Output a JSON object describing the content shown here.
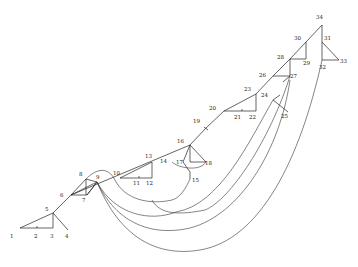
{
  "diagram": {
    "type": "tree-with-arcs",
    "background": "#ffffff",
    "stroke_color": "#222222",
    "nodes": [
      {
        "id": "1",
        "label": "1",
        "x": 20,
        "y": 228,
        "lx": 10,
        "ly": 238
      },
      {
        "id": "2",
        "label": "2",
        "x": 37,
        "y": 228,
        "lx": 34,
        "ly": 238
      },
      {
        "id": "3",
        "label": "3",
        "x": 53,
        "y": 228,
        "lx": 50,
        "ly": 238
      },
      {
        "id": "4",
        "label": "4",
        "x": 68,
        "y": 230,
        "lx": 65,
        "ly": 238
      },
      {
        "id": "5",
        "label": "5",
        "x": 53,
        "y": 213,
        "lx": 45,
        "ly": 211
      },
      {
        "id": "6",
        "label": "6",
        "x": 71,
        "y": 195,
        "lx": 60,
        "ly": 197
      },
      {
        "id": "7",
        "label": "7",
        "x": 87,
        "y": 195,
        "lx": 82,
        "ly": 202
      },
      {
        "id": "8",
        "label": "8",
        "x": 86,
        "y": 179,
        "lx": 79,
        "ly": 176
      },
      {
        "id": "9",
        "label": "9",
        "x": 97,
        "y": 182,
        "lx": 96,
        "ly": 179
      },
      {
        "id": "10",
        "label": "10",
        "x": 120,
        "y": 178,
        "lx": 113,
        "ly": 175
      },
      {
        "id": "11",
        "label": "11",
        "x": 139,
        "y": 178,
        "lx": 133,
        "ly": 185
      },
      {
        "id": "12",
        "label": "12",
        "x": 152,
        "y": 178,
        "lx": 146,
        "ly": 185
      },
      {
        "id": "13",
        "label": "13",
        "x": 152,
        "y": 162,
        "lx": 145,
        "ly": 158
      },
      {
        "id": "14",
        "label": "14",
        "x": 172,
        "y": 162,
        "lx": 160,
        "ly": 163
      },
      {
        "id": "15",
        "label": "15",
        "x": 190,
        "y": 179,
        "lx": 192,
        "ly": 182
      },
      {
        "id": "16",
        "label": "16",
        "x": 190,
        "y": 145,
        "lx": 177,
        "ly": 143
      },
      {
        "id": "17",
        "label": "17",
        "x": 183,
        "y": 162,
        "lx": 176,
        "ly": 164
      },
      {
        "id": "18",
        "label": "18",
        "x": 206,
        "y": 162,
        "lx": 205,
        "ly": 165
      },
      {
        "id": "19",
        "label": "19",
        "x": 206,
        "y": 128,
        "lx": 193,
        "ly": 123
      },
      {
        "id": "20",
        "label": "20",
        "x": 224,
        "y": 111,
        "lx": 209,
        "ly": 110
      },
      {
        "id": "21",
        "label": "21",
        "x": 242,
        "y": 111,
        "lx": 234,
        "ly": 119
      },
      {
        "id": "22",
        "label": "22",
        "x": 256,
        "y": 111,
        "lx": 249,
        "ly": 119
      },
      {
        "id": "23",
        "label": "23",
        "x": 256,
        "y": 94,
        "lx": 244,
        "ly": 91
      },
      {
        "id": "24",
        "label": "24",
        "x": 273,
        "y": 94,
        "lx": 261,
        "ly": 97
      },
      {
        "id": "25",
        "label": "25",
        "x": 288,
        "y": 112,
        "lx": 281,
        "ly": 118
      },
      {
        "id": "26",
        "label": "26",
        "x": 273,
        "y": 76,
        "lx": 259,
        "ly": 77
      },
      {
        "id": "27",
        "label": "27",
        "x": 290,
        "y": 76,
        "lx": 290,
        "ly": 78
      },
      {
        "id": "28",
        "label": "28",
        "x": 290,
        "y": 59,
        "lx": 277,
        "ly": 59
      },
      {
        "id": "29",
        "label": "29",
        "x": 306,
        "y": 59,
        "lx": 303,
        "ly": 65
      },
      {
        "id": "30",
        "label": "30",
        "x": 306,
        "y": 42,
        "lx": 294,
        "ly": 40
      },
      {
        "id": "31",
        "label": "31",
        "x": 322,
        "y": 42,
        "lx": 324,
        "ly": 40
      },
      {
        "id": "32",
        "label": "32",
        "x": 322,
        "y": 60,
        "lx": 319,
        "ly": 69
      },
      {
        "id": "33",
        "label": "33",
        "x": 339,
        "y": 60,
        "lx": 340,
        "ly": 63
      },
      {
        "id": "34",
        "label": "34",
        "x": 322,
        "y": 25,
        "lx": 316,
        "ly": 19
      }
    ]
  }
}
